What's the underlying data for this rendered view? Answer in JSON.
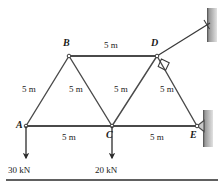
{
  "figure": {
    "type": "truss-diagram",
    "colors": {
      "member": "#4a4a4a",
      "text": "#1a1a1a",
      "wall_dark": "#6e6e6e",
      "wall_light": "#d8d8d8",
      "background": "#ffffff",
      "rule": "#2b2b2b"
    },
    "nodes": [
      {
        "id": "A",
        "label": "A",
        "x": 26,
        "y": 126
      },
      {
        "id": "B",
        "label": "B",
        "x": 69,
        "y": 56
      },
      {
        "id": "C",
        "label": "C",
        "x": 112,
        "y": 126
      },
      {
        "id": "D",
        "label": "D",
        "x": 157,
        "y": 56
      },
      {
        "id": "E",
        "label": "E",
        "x": 197,
        "y": 126
      }
    ],
    "members": [
      {
        "id": "AB",
        "from": "A",
        "to": "B",
        "length_label": "5 m"
      },
      {
        "id": "BC",
        "from": "B",
        "to": "C",
        "length_label": "5 m"
      },
      {
        "id": "CD",
        "from": "C",
        "to": "D",
        "length_label": "5 m"
      },
      {
        "id": "DE",
        "from": "D",
        "to": "E",
        "length_label": "5 m"
      },
      {
        "id": "BD",
        "from": "B",
        "to": "D",
        "length_label": "5 m"
      },
      {
        "id": "AC",
        "from": "A",
        "to": "C",
        "length_label": "5 m"
      },
      {
        "id": "CE",
        "from": "C",
        "to": "E",
        "length_label": "5 m"
      }
    ],
    "dimension_labels": [
      {
        "id": "dim-ab",
        "text": "5 m",
        "x": 22,
        "y": 85
      },
      {
        "id": "dim-bd",
        "text": "5 m",
        "x": 104,
        "y": 41
      },
      {
        "id": "dim-bc",
        "text": "5 m",
        "x": 69,
        "y": 85
      },
      {
        "id": "dim-cd",
        "text": "5 m",
        "x": 114,
        "y": 85
      },
      {
        "id": "dim-de",
        "text": "5 m",
        "x": 160,
        "y": 85
      },
      {
        "id": "dim-ac",
        "text": "5 m",
        "x": 62,
        "y": 138
      },
      {
        "id": "dim-ce",
        "text": "5 m",
        "x": 150,
        "y": 138
      }
    ],
    "loads": [
      {
        "id": "load-A",
        "at_node": "A",
        "label": "30 kN",
        "direction": "down",
        "x": 26,
        "y": 126,
        "length": 34
      },
      {
        "id": "load-C",
        "at_node": "C",
        "label": "20 kN",
        "direction": "down",
        "x": 112,
        "y": 126,
        "length": 34
      }
    ],
    "supports": [
      {
        "id": "support-D",
        "at_node": "D",
        "kind": "inclined-link",
        "note": "two-force link to wall, perpendicular marker at D",
        "link_end_x": 210,
        "link_end_y": 23
      },
      {
        "id": "support-E",
        "at_node": "E",
        "kind": "pin",
        "note": "pin support bearing on right vertical wall"
      }
    ],
    "walls": [
      {
        "id": "wall-upper-right",
        "x": 207,
        "y": 8,
        "width": 10,
        "height": 34
      },
      {
        "id": "wall-lower-right",
        "x": 203,
        "y": 110,
        "width": 10,
        "height": 37
      }
    ],
    "footer_rule": {
      "x1": 6,
      "y1": 180,
      "x2": 218,
      "y2": 180
    }
  }
}
